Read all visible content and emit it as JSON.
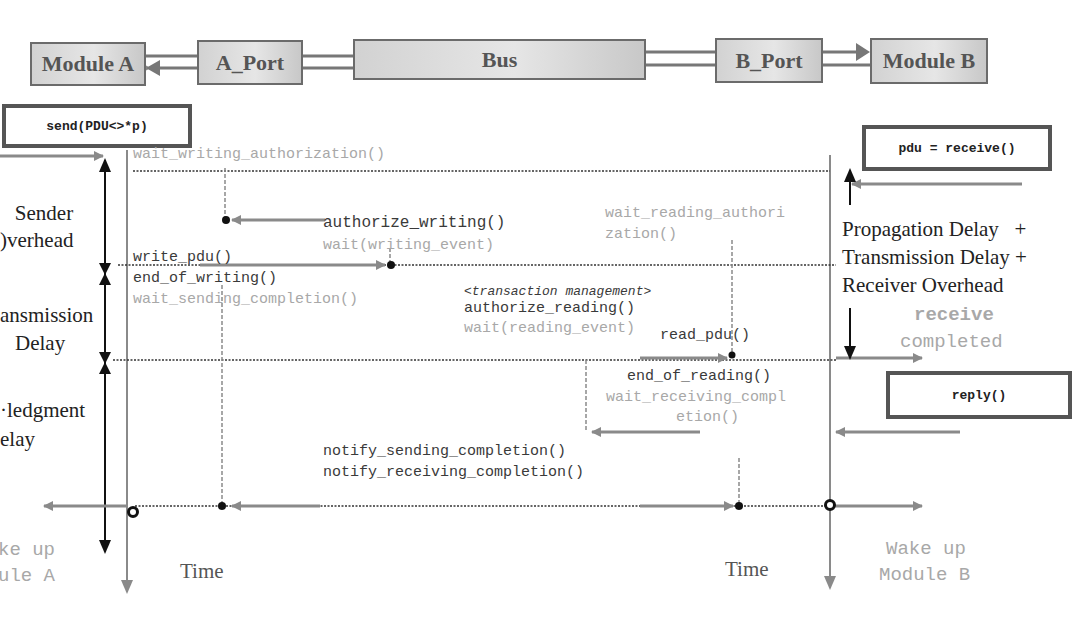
{
  "blocks": {
    "module_a": "Module A",
    "a_port": "A_Port",
    "bus": "Bus",
    "b_port": "B_Port",
    "module_b": "Module B"
  },
  "call_boxes": {
    "send": "send(PDU<>*p)",
    "receive": "pdu = receive()",
    "reply": "reply()"
  },
  "sender_side": {
    "wait_writing_authorization": "wait_writing_authorization()",
    "write_pdu": "write_pdu()",
    "end_of_writing": "end_of_writing()",
    "wait_sending_completion": "wait_sending_completion()"
  },
  "bus_side": {
    "authorize_writing": "authorize_writing()",
    "wait_writing_event": "wait(writing_event)",
    "transaction_management": "<transaction management>",
    "authorize_reading": "authorize_reading()",
    "wait_reading_event": "wait(reading_event)",
    "notify_sending_completion": "notify_sending_completion()",
    "notify_receiving_completion": "notify_receiving_completion()"
  },
  "receiver_side": {
    "wait_reading_authorization_1": "wait_reading_authori",
    "wait_reading_authorization_2": "zation()",
    "read_pdu": "read_pdu()",
    "end_of_reading": "end_of_reading()",
    "wait_receiving_completion_1": "wait_receiving_compl",
    "wait_receiving_completion_2": "etion()"
  },
  "delay_labels": {
    "sender_overhead_1": "Sender",
    "sender_overhead_2": ")verhead",
    "transmission_delay_1": "ansmission",
    "transmission_delay_2": "Delay",
    "ack_delay_1": "·ledgment",
    "ack_delay_2": "elay",
    "right_delay_1": "Propagation Delay   +",
    "right_delay_2": "Transmission Delay +",
    "right_delay_3": "Receiver Overhead"
  },
  "status": {
    "receive_word": "receive",
    "completed_word": "completed",
    "wake_up_a_1": "ke up",
    "wake_up_a_2": "ule A",
    "wake_up_b_1": "Wake up",
    "wake_up_b_2": "Module B"
  },
  "axes": {
    "time_left": "Time",
    "time_right": "Time"
  },
  "colors": {
    "dark_text": "#3a3a3a",
    "gray_text": "#a8a8a8",
    "arrow_gray": "#8a8a8a",
    "black": "#111111"
  }
}
